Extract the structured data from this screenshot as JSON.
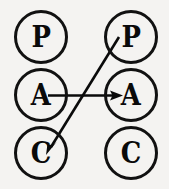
{
  "diagram": {
    "background_color": "#f4f3f1",
    "stroke_color": "#0a0a0a",
    "columns": [
      {
        "name": "left-column",
        "nodes": [
          {
            "id": "left-p",
            "label": "P",
            "cx": 41,
            "cy": 37,
            "r": 27
          },
          {
            "id": "left-a",
            "label": "A",
            "cx": 41,
            "cy": 95,
            "r": 27
          },
          {
            "id": "left-c",
            "label": "C",
            "cx": 41,
            "cy": 153,
            "r": 27
          }
        ]
      },
      {
        "name": "right-column",
        "nodes": [
          {
            "id": "right-p",
            "label": "P",
            "cx": 131,
            "cy": 37,
            "r": 27
          },
          {
            "id": "right-a",
            "label": "A",
            "cx": 131,
            "cy": 95,
            "r": 27
          },
          {
            "id": "right-c",
            "label": "C",
            "cx": 131,
            "cy": 153,
            "r": 27
          }
        ]
      }
    ],
    "edges": [
      {
        "id": "edge-a-to-a",
        "label": "",
        "from": "left-a",
        "to": "right-a",
        "x1": 48,
        "y1": 95,
        "x2": 122,
        "y2": 95,
        "arrow": "end"
      },
      {
        "id": "edge-p-to-c",
        "label": "",
        "from": "right-p",
        "to": "left-c",
        "x1": 119,
        "y1": 37,
        "x2": 47,
        "y2": 153,
        "arrow": "end"
      }
    ]
  }
}
